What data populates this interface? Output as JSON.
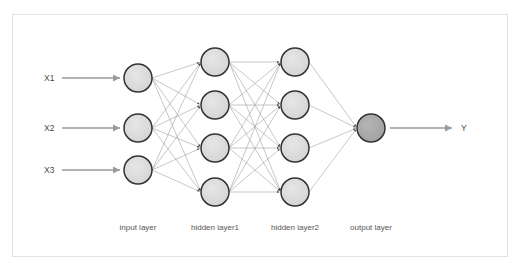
{
  "figure": {
    "background_color": "#ffffff",
    "frame_color": "#e2e2e2"
  },
  "colors": {
    "node_fill": "#dcdcdc",
    "node_stroke": "#333333",
    "output_node_fill": "#a8a8a8",
    "connection_line": "#999999",
    "io_arrow": "#9a9a9a",
    "label_text": "#555555"
  },
  "inputs": [
    {
      "label": "X1",
      "x": 44,
      "y": 81,
      "arrow_from": 62,
      "arrow_to": 120
    },
    {
      "label": "X2",
      "x": 44,
      "y": 131,
      "arrow_from": 62,
      "arrow_to": 120
    },
    {
      "label": "X3",
      "x": 44,
      "y": 173,
      "arrow_from": 62,
      "arrow_to": 120
    }
  ],
  "outputs": [
    {
      "label": "Y",
      "x": 461,
      "y": 131,
      "arrow_from": 390,
      "arrow_to": 452
    }
  ],
  "layers": [
    {
      "name": "input layer",
      "label": "input layer",
      "label_x": 138,
      "label_y": 230,
      "node_count": 3,
      "cx": 138,
      "radius": 14,
      "fill": "#dcdcdc",
      "nodes_y": [
        78,
        128,
        170
      ]
    },
    {
      "name": "hidden layer1",
      "label": "hidden layer1",
      "label_x": 215,
      "label_y": 230,
      "node_count": 4,
      "cx": 215,
      "radius": 14,
      "fill": "#dcdcdc",
      "nodes_y": [
        62,
        105,
        148,
        192
      ]
    },
    {
      "name": "hidden layer2",
      "label": "hidden layer2",
      "label_x": 295,
      "label_y": 230,
      "node_count": 4,
      "cx": 295,
      "radius": 14,
      "fill": "#dcdcdc",
      "nodes_y": [
        62,
        105,
        148,
        192
      ]
    },
    {
      "name": "output layer",
      "label": "output layer",
      "label_x": 371,
      "label_y": 230,
      "node_count": 1,
      "cx": 371,
      "radius": 14,
      "fill": "#a8a8a8",
      "nodes_y": [
        128
      ]
    }
  ]
}
